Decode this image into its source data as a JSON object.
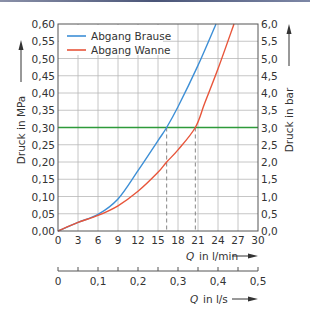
{
  "chart_data": {
    "type": "line",
    "title": "",
    "xlabel": "Q in l/min",
    "xlabel_secondary": "Q in l/s",
    "ylabel": "Druck in MPa",
    "ylabel_right": "Druck in bar",
    "xlim": [
      0,
      30
    ],
    "ylim": [
      0,
      0.6
    ],
    "ylim_right": [
      0,
      6.0
    ],
    "xlim_secondary": [
      0,
      0.5
    ],
    "grid": true,
    "legend_position": "upper-left",
    "x_ticks": [
      "0",
      "3",
      "6",
      "9",
      "12",
      "15",
      "18",
      "21",
      "24",
      "27",
      "30"
    ],
    "y_ticks": [
      "0,00",
      "0,05",
      "0,10",
      "0,15",
      "0,20",
      "0,25",
      "0,30",
      "0,35",
      "0,40",
      "0,45",
      "0,50",
      "0,55",
      "0,60"
    ],
    "y_ticks_right": [
      "0,0",
      "0,5",
      "1,0",
      "1,5",
      "2,0",
      "2,5",
      "3,0",
      "3,5",
      "4,0",
      "4,5",
      "5,0",
      "5,5",
      "6,0"
    ],
    "x_ticks_secondary": [
      "0",
      "0,1",
      "0,2",
      "0,3",
      "0,4",
      "0,5"
    ],
    "series": [
      {
        "name": "Abgang Brause",
        "color": "#3d8fd6",
        "x": [
          0,
          3,
          6,
          9,
          12,
          15,
          16.3,
          18,
          21,
          23.7
        ],
        "values": [
          0,
          0.025,
          0.048,
          0.093,
          0.175,
          0.262,
          0.3,
          0.36,
          0.48,
          0.6
        ]
      },
      {
        "name": "Abgang Wanne",
        "color": "#e8553a",
        "x": [
          0,
          3,
          6,
          9,
          12,
          15,
          16.3,
          18,
          20.6,
          22,
          24,
          26.4
        ],
        "values": [
          0,
          0.025,
          0.045,
          0.073,
          0.115,
          0.17,
          0.2,
          0.235,
          0.3,
          0.37,
          0.47,
          0.6
        ]
      }
    ],
    "reference_line": {
      "y": 0.3,
      "color": "#2e9a3a",
      "label": "0,30 MPa / 3,0 bar"
    },
    "markers": [
      {
        "type": "dashed-vertical",
        "x": 16.3,
        "y_top": 0.3
      },
      {
        "type": "dashed-vertical",
        "x": 20.6,
        "y_top": 0.3
      }
    ]
  },
  "labels": {
    "legend": [
      "Abgang Brause",
      "Abgang Wanne"
    ],
    "ylabel_left": "Druck in MPa",
    "ylabel_right": "Druck in bar",
    "xlabel_primary_sym": "Q",
    "xlabel_primary_unit": "in l/min",
    "xlabel_secondary_sym": "Q",
    "xlabel_secondary_unit": "in l/s"
  },
  "colors": {
    "grid": "#b8b8b8",
    "axis": "#555555",
    "text": "#333333"
  }
}
